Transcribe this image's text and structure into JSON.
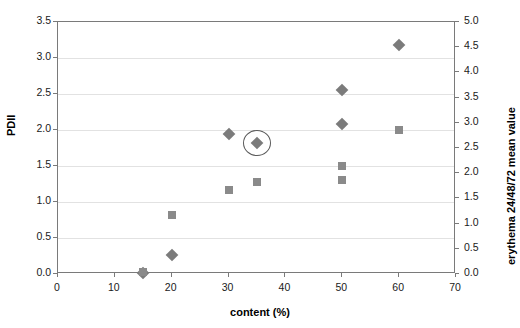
{
  "chart_data": {
    "type": "scatter",
    "title": "",
    "subtitle": "",
    "xlabel": "content (%)",
    "ylabel": "PDII",
    "y2label": "erythema 24/48/72 mean value",
    "xlim": [
      0,
      70
    ],
    "ylim": [
      0.0,
      3.5
    ],
    "y2lim": [
      0.0,
      5.0
    ],
    "grid": "horizontal",
    "legend": "none",
    "x_ticks": [
      "0",
      "10",
      "20",
      "30",
      "40",
      "50",
      "60",
      "70"
    ],
    "x_tick_values": [
      0,
      10,
      20,
      30,
      40,
      50,
      60,
      70
    ],
    "y_ticks": [
      "0.0",
      "0.5",
      "1.0",
      "1.5",
      "2.0",
      "2.5",
      "3.0",
      "3.5"
    ],
    "y_tick_values": [
      0.0,
      0.5,
      1.0,
      1.5,
      2.0,
      2.5,
      3.0,
      3.5
    ],
    "y2_ticks": [
      "0.0",
      "0.5",
      "1.0",
      "1.5",
      "2.0",
      "2.5",
      "3.0",
      "3.5",
      "4.0",
      "4.5",
      "5.0"
    ],
    "y2_tick_values": [
      0.0,
      0.5,
      1.0,
      1.5,
      2.0,
      2.5,
      3.0,
      3.5,
      4.0,
      4.5,
      5.0
    ],
    "series": [
      {
        "name": "PDII",
        "marker": "diamond",
        "color": "#7b7b7b",
        "axis": "left",
        "points": [
          {
            "x": 15,
            "y": 0.02
          },
          {
            "x": 20,
            "y": 0.27
          },
          {
            "x": 30,
            "y": 1.95
          },
          {
            "x": 35,
            "y": 1.82
          },
          {
            "x": 50,
            "y": 2.56
          },
          {
            "x": 50,
            "y": 2.08
          },
          {
            "x": 60,
            "y": 3.18
          }
        ]
      },
      {
        "name": "erythema 24/48/72 mean value",
        "marker": "square",
        "color": "#8a8a8a",
        "axis": "right",
        "points": [
          {
            "x": 15,
            "y": 0.03
          },
          {
            "x": 20,
            "y": 1.18
          },
          {
            "x": 30,
            "y": 1.67
          },
          {
            "x": 35,
            "y": 1.82
          },
          {
            "x": 50,
            "y": 2.15
          },
          {
            "x": 50,
            "y": 1.87
          },
          {
            "x": 60,
            "y": 2.86
          }
        ]
      }
    ],
    "annotations": [
      {
        "type": "ellipse",
        "x": 35,
        "y": 1.82,
        "label": ""
      }
    ],
    "colors": {
      "series_diamond": "#7b7b7b",
      "series_square": "#8a8a8a",
      "gridline": "#e2e2e2",
      "axis": "#7a7a7a",
      "background": "#ffffff",
      "text": "#1a1a1a"
    }
  }
}
